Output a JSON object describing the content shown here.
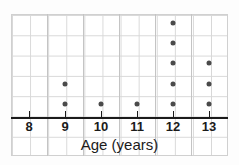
{
  "chart_data": {
    "type": "scatter",
    "plot_kind": "dot-plot",
    "title": "",
    "xlabel": "Age (years)",
    "ylabel": "",
    "categories": [
      "8",
      "9",
      "10",
      "11",
      "12",
      "13"
    ],
    "values": [
      0,
      2,
      1,
      1,
      5,
      3
    ],
    "x": [
      8,
      9,
      10,
      11,
      12,
      13
    ],
    "counts": {
      "8": 0,
      "9": 2,
      "10": 1,
      "11": 1,
      "12": 5,
      "13": 3
    },
    "xlim": [
      7.5,
      13.6
    ],
    "ylim": [
      0,
      7
    ],
    "grid": true,
    "legend": null,
    "annotations": [],
    "marker_color": "#4a4a4a",
    "axis_color": "#1b1b1b",
    "grid_color": "#d8d8d8",
    "background_color": "#ffffff"
  },
  "axis": {
    "title": "Age (years)",
    "tick_labels": [
      "8",
      "9",
      "10",
      "11",
      "12",
      "13"
    ]
  }
}
